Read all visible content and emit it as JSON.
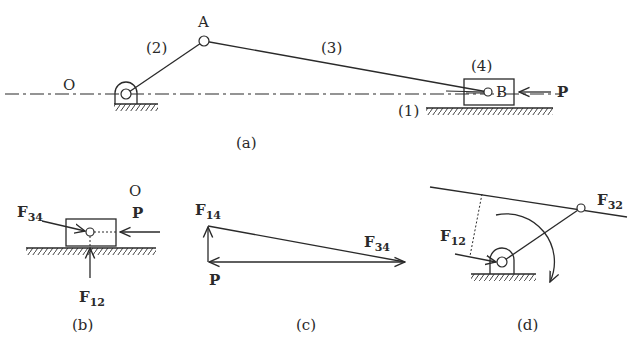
{
  "figure": {
    "a": {
      "caption": "(a)",
      "points": {
        "O": "O",
        "A": "A",
        "B": "B"
      },
      "links": {
        "link2": "(2)",
        "link3": "(3)",
        "link4": "(4)",
        "ground": "(1)"
      },
      "force": "P"
    },
    "b": {
      "caption": "(b)",
      "point": "O",
      "force_P": "P",
      "force_F34": {
        "main": "F",
        "sub": "34"
      },
      "force_F12": {
        "main": "F",
        "sub": "12"
      }
    },
    "c": {
      "caption": "(c)",
      "force_F14": {
        "main": "F",
        "sub": "14"
      },
      "force_F34": {
        "main": "F",
        "sub": "34"
      },
      "force_P": "P"
    },
    "d": {
      "caption": "(d)",
      "force_F12": {
        "main": "F",
        "sub": "12"
      },
      "force_F32": {
        "main": "F",
        "sub": "32"
      }
    }
  }
}
